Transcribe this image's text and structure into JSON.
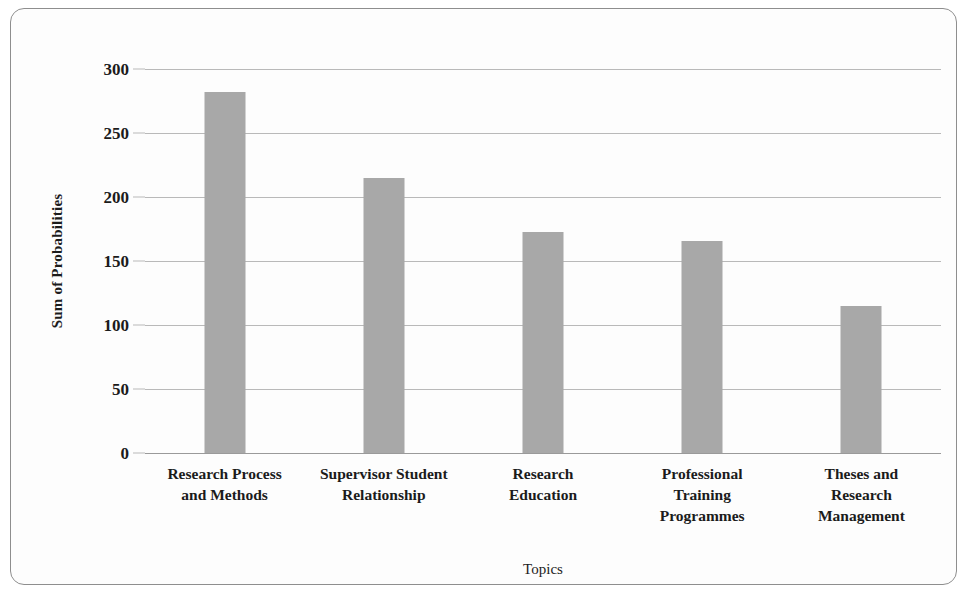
{
  "chart_data": {
    "type": "bar",
    "title": "",
    "xlabel": "Topics",
    "ylabel": "Sum of Probabilities",
    "categories": [
      "Research Process and Methods",
      "Supervisor Student Relationship",
      "Research Education",
      "Professional Training Programmes",
      "Theses and Research Management"
    ],
    "category_lines": [
      [
        "Research Process",
        "and Methods"
      ],
      [
        "Supervisor Student",
        "Relationship"
      ],
      [
        "Research",
        "Education"
      ],
      [
        "Professional",
        "Training",
        "Programmes"
      ],
      [
        "Theses and",
        "Research",
        "Management"
      ]
    ],
    "values": [
      282,
      215,
      173,
      166,
      115
    ],
    "ylim": [
      0,
      300
    ],
    "yticks": [
      0,
      50,
      100,
      150,
      200,
      250,
      300
    ],
    "ytick_labels": [
      "0",
      "50",
      "100",
      "150",
      "200",
      "250",
      "300"
    ],
    "grid": true,
    "legend": false,
    "bar_color": "#a8a8a8",
    "grid_color": "#b9b9b9",
    "axis_color": "#9a9a9a",
    "text_color": "#1b1b1b",
    "frame_color": "#8e8e8e",
    "background": "#fdfdfd"
  }
}
